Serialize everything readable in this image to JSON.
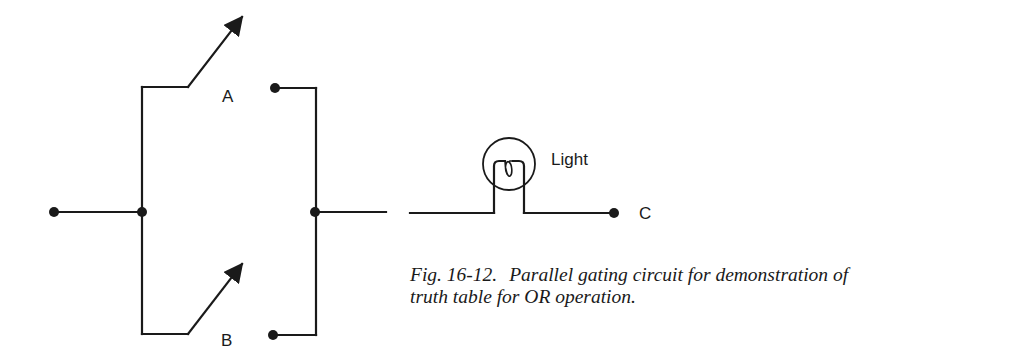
{
  "diagram": {
    "type": "circuit",
    "labels": {
      "switch_a": "A",
      "switch_b": "B",
      "lamp": "Light",
      "output": "C"
    },
    "components": [
      {
        "id": "switch-a",
        "kind": "switch",
        "state": "open",
        "label": "A"
      },
      {
        "id": "switch-b",
        "kind": "switch",
        "state": "open",
        "label": "B"
      },
      {
        "id": "lamp",
        "kind": "light-bulb",
        "label": "Light"
      },
      {
        "id": "terminal-c",
        "kind": "terminal",
        "label": "C"
      }
    ],
    "colors": {
      "ink": "#1a1a1a",
      "background": "#ffffff"
    }
  },
  "caption": {
    "figure_number": "Fig. 16-12.",
    "line1": "Parallel gating circuit for demonstration of",
    "line2": "truth table for OR operation."
  }
}
